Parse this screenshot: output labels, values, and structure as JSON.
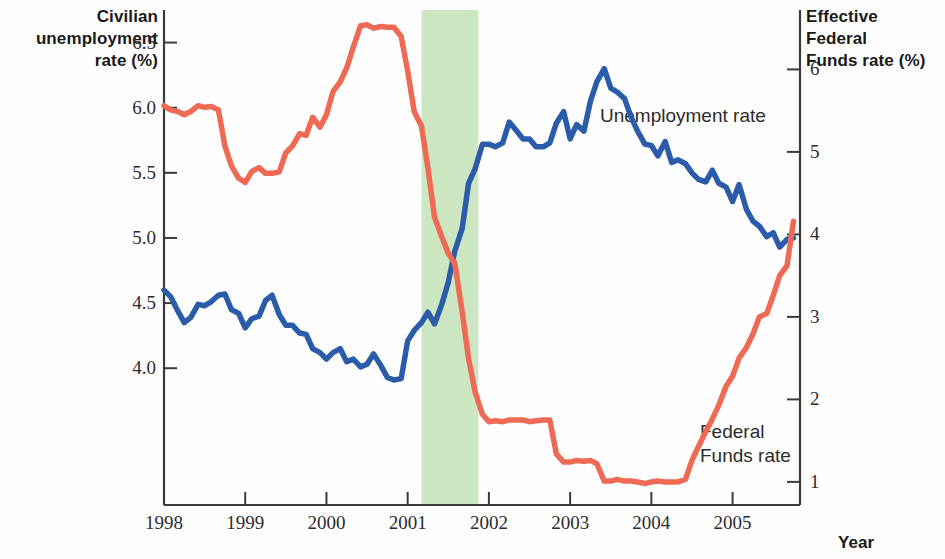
{
  "chart_data": {
    "type": "line",
    "title": "",
    "xlabel": "Year",
    "ylabel": "Civilian unemployment rate (%)",
    "ylabel_right": "Effective Federal Funds rate (%)",
    "xlim": [
      1998.0,
      2005.83
    ],
    "ylim_left": [
      2.95,
      6.75
    ],
    "ylim_right": [
      0.72,
      6.72
    ],
    "grid": false,
    "legend_position": "inline-annotations",
    "x_ticks": [
      "1998",
      "1999",
      "2000",
      "2001",
      "2002",
      "2003",
      "2004",
      "2005"
    ],
    "x_tick_values": [
      1998,
      1999,
      2000,
      2001,
      2002,
      2003,
      2004,
      2005
    ],
    "y_ticks_left": [
      "4.0",
      "4.5",
      "5.0",
      "5.5",
      "6.0",
      "6.5"
    ],
    "y_tick_values_left": [
      4.0,
      4.5,
      5.0,
      5.5,
      6.0,
      6.5
    ],
    "y_ticks_right": [
      "1",
      "2",
      "3",
      "4",
      "5",
      "6"
    ],
    "y_tick_values_right": [
      1,
      2,
      3,
      4,
      5,
      6
    ],
    "annotations": [
      {
        "text": "Unemployment rate",
        "series": "unemployment_rate",
        "x": 2002.55,
        "y": 6.35
      },
      {
        "text": "Federal\nFunds rate",
        "series": "federal_funds_rate",
        "x": 2004.95,
        "y": 1.95
      }
    ],
    "shaded_regions": [
      {
        "label": "recession",
        "x_start": 2001.17,
        "x_end": 2001.87,
        "color": "#cbe6c0"
      }
    ],
    "series": [
      {
        "name": "Unemployment rate",
        "axis": "left",
        "color": "#2a5caa",
        "x": [
          1998.0,
          1998.08,
          1998.17,
          1998.25,
          1998.33,
          1998.42,
          1998.5,
          1998.58,
          1998.67,
          1998.75,
          1998.83,
          1998.92,
          1999.0,
          1999.08,
          1999.17,
          1999.25,
          1999.33,
          1999.42,
          1999.5,
          1999.58,
          1999.67,
          1999.75,
          1999.83,
          1999.92,
          2000.0,
          2000.08,
          2000.17,
          2000.25,
          2000.33,
          2000.42,
          2000.5,
          2000.58,
          2000.67,
          2000.75,
          2000.83,
          2000.92,
          2001.0,
          2001.08,
          2001.17,
          2001.25,
          2001.33,
          2001.42,
          2001.5,
          2001.58,
          2001.67,
          2001.75,
          2001.83,
          2001.92,
          2002.0,
          2002.08,
          2002.17,
          2002.25,
          2002.33,
          2002.42,
          2002.5,
          2002.58,
          2002.67,
          2002.75,
          2002.83,
          2002.92,
          2003.0,
          2003.08,
          2003.17,
          2003.25,
          2003.33,
          2003.42,
          2003.5,
          2003.58,
          2003.67,
          2003.75,
          2003.83,
          2003.92,
          2004.0,
          2004.08,
          2004.17,
          2004.25,
          2004.33,
          2004.42,
          2004.5,
          2004.58,
          2004.67,
          2004.75,
          2004.83,
          2004.92,
          2005.0,
          2005.08,
          2005.17,
          2005.25,
          2005.33,
          2005.42,
          2005.5,
          2005.58,
          2005.67,
          2005.75
        ],
        "values": [
          4.6,
          4.55,
          4.44,
          4.35,
          4.39,
          4.49,
          4.48,
          4.51,
          4.56,
          4.57,
          4.45,
          4.42,
          4.31,
          4.38,
          4.4,
          4.52,
          4.56,
          4.41,
          4.33,
          4.33,
          4.27,
          4.26,
          4.15,
          4.12,
          4.07,
          4.12,
          4.15,
          4.05,
          4.07,
          4.01,
          4.03,
          4.11,
          4.02,
          3.93,
          3.91,
          3.92,
          4.21,
          4.29,
          4.35,
          4.43,
          4.34,
          4.49,
          4.66,
          4.9,
          5.07,
          5.42,
          5.53,
          5.72,
          5.72,
          5.7,
          5.73,
          5.89,
          5.83,
          5.76,
          5.76,
          5.7,
          5.7,
          5.73,
          5.88,
          5.97,
          5.76,
          5.87,
          5.82,
          6.05,
          6.2,
          6.3,
          6.15,
          6.12,
          6.07,
          5.93,
          5.82,
          5.72,
          5.71,
          5.63,
          5.74,
          5.58,
          5.6,
          5.57,
          5.5,
          5.45,
          5.43,
          5.52,
          5.42,
          5.39,
          5.28,
          5.41,
          5.22,
          5.13,
          5.09,
          5.01,
          5.04,
          4.93,
          4.99,
          5.0
        ]
      },
      {
        "name": "Federal Funds rate",
        "axis": "right",
        "color": "#ee6a55",
        "x": [
          1998.0,
          1998.08,
          1998.17,
          1998.25,
          1998.33,
          1998.42,
          1998.5,
          1998.58,
          1998.67,
          1998.75,
          1998.83,
          1998.92,
          1999.0,
          1999.08,
          1999.17,
          1999.25,
          1999.33,
          1999.42,
          1999.5,
          1999.58,
          1999.67,
          1999.75,
          1999.83,
          1999.92,
          2000.0,
          2000.08,
          2000.17,
          2000.25,
          2000.33,
          2000.42,
          2000.5,
          2000.58,
          2000.67,
          2000.75,
          2000.83,
          2000.92,
          2001.0,
          2001.08,
          2001.17,
          2001.25,
          2001.33,
          2001.42,
          2001.5,
          2001.58,
          2001.67,
          2001.75,
          2001.83,
          2001.92,
          2002.0,
          2002.08,
          2002.17,
          2002.25,
          2002.33,
          2002.42,
          2002.5,
          2002.58,
          2002.67,
          2002.75,
          2002.83,
          2002.92,
          2003.0,
          2003.08,
          2003.17,
          2003.25,
          2003.33,
          2003.42,
          2003.5,
          2003.58,
          2003.67,
          2003.75,
          2003.83,
          2003.92,
          2004.0,
          2004.08,
          2004.17,
          2004.25,
          2004.33,
          2004.42,
          2004.5,
          2004.58,
          2004.67,
          2004.75,
          2004.83,
          2004.92,
          2005.0,
          2005.08,
          2005.17,
          2005.25,
          2005.33,
          2005.42,
          2005.5,
          2005.58,
          2005.67,
          2005.75
        ],
        "values": [
          5.56,
          5.51,
          5.49,
          5.45,
          5.49,
          5.56,
          5.54,
          5.55,
          5.51,
          5.07,
          4.83,
          4.68,
          4.63,
          4.76,
          4.81,
          4.74,
          4.74,
          4.76,
          4.99,
          5.07,
          5.22,
          5.2,
          5.42,
          5.3,
          5.45,
          5.73,
          5.85,
          6.02,
          6.27,
          6.53,
          6.54,
          6.5,
          6.52,
          6.51,
          6.51,
          6.4,
          5.98,
          5.49,
          5.31,
          4.8,
          4.21,
          3.97,
          3.77,
          3.65,
          3.07,
          2.49,
          2.09,
          1.82,
          1.73,
          1.74,
          1.73,
          1.75,
          1.75,
          1.75,
          1.73,
          1.74,
          1.75,
          1.75,
          1.34,
          1.24,
          1.24,
          1.26,
          1.25,
          1.26,
          1.22,
          1.01,
          1.01,
          1.03,
          1.01,
          1.01,
          1.0,
          0.98,
          1.0,
          1.01,
          1.0,
          1.0,
          1.0,
          1.03,
          1.26,
          1.43,
          1.61,
          1.76,
          1.93,
          2.16,
          2.28,
          2.5,
          2.63,
          2.79,
          3.0,
          3.04,
          3.26,
          3.5,
          3.62,
          4.16
        ]
      }
    ]
  },
  "axes": {
    "left_title": "Civilian\nunemployment\nrate (%)",
    "right_title": "Effective\nFederal\nFunds rate (%)",
    "x_title": "Year"
  },
  "labels": {
    "unemployment": "Unemployment rate",
    "federal_funds": "Federal\nFunds rate"
  },
  "colors": {
    "unemployment": "#2a5caa",
    "federal_funds": "#ee6a55",
    "recession_band": "#cbe6c0",
    "axis": "#3b3b3b",
    "text": "#231f20"
  }
}
